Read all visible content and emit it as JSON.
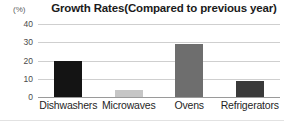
{
  "chart_data": {
    "type": "bar",
    "title": "Growth Rates(Compared to previous year)",
    "xlabel": "",
    "ylabel": "(%)",
    "categories": [
      "Dishwashers",
      "Microwaves",
      "Ovens",
      "Refrigerators"
    ],
    "values": [
      19.5,
      4,
      29,
      9
    ],
    "series": [
      {
        "name": "Growth Rate",
        "values": [
          19.5,
          4,
          29,
          9
        ]
      }
    ],
    "bar_colors": [
      "#141414",
      "#c6c6c6",
      "#6e6e6e",
      "#3a3a3a"
    ],
    "ylim": [
      0,
      40
    ],
    "yticks": [
      "0",
      "10",
      "20",
      "30",
      "40"
    ],
    "ytick_values": [
      0,
      10,
      20,
      30,
      40
    ],
    "grid": true,
    "legend": false,
    "legend_position": "none"
  },
  "axis": {
    "unit_label": "(%)"
  },
  "colors": {
    "gridline": "#cfcfcf",
    "baseline": "#9a9a9a",
    "text": "#1f1f1f",
    "background": "#ffffff"
  }
}
